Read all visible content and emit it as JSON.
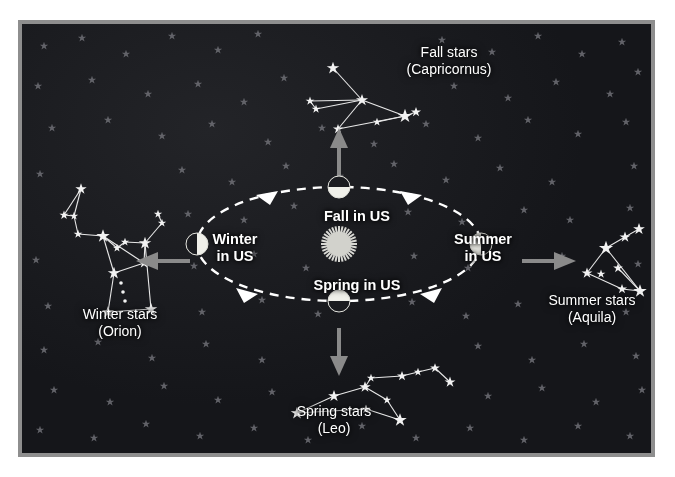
{
  "diagram": {
    "type": "astronomy-orbit-diagram",
    "background_color": "#15161a",
    "frame_color": "#8e8e8e",
    "page_color": "#ffffff"
  },
  "sun": {
    "name": "Sun",
    "color": "#d7d7d2",
    "cx": 334,
    "cy": 237
  },
  "orbit": {
    "style": "dashed-ellipse",
    "color": "#ffffff",
    "direction": "counterclockwise",
    "cx": 334,
    "cy": 237,
    "rx": 142,
    "ry": 57
  },
  "season_labels": [
    {
      "id": "fall",
      "text": "Fall in US",
      "position": "top"
    },
    {
      "id": "winter",
      "text": "Winter\nin US",
      "position": "left"
    },
    {
      "id": "summer",
      "text": "Summer\nin US",
      "position": "right"
    },
    {
      "id": "spring",
      "text": "Spring in US",
      "position": "bottom"
    }
  ],
  "constellation_labels": [
    {
      "id": "fall",
      "line1": "Fall stars",
      "line2": "(Capricornus)",
      "position": "top"
    },
    {
      "id": "winter",
      "line1": "Winter stars",
      "line2": "(Orion)",
      "position": "left"
    },
    {
      "id": "summer",
      "line1": "Summer stars",
      "line2": "(Aquila)",
      "position": "right"
    },
    {
      "id": "spring",
      "line1": "Spring stars",
      "line2": "(Leo)",
      "position": "bottom"
    }
  ],
  "earth_positions": [
    {
      "id": "fall",
      "cx": 334,
      "cy": 180,
      "lit_half": "bottom",
      "season": "Fall in US"
    },
    {
      "id": "winter",
      "cx": 192,
      "cy": 237,
      "lit_half": "right",
      "season": "Winter in US"
    },
    {
      "id": "summer",
      "cx": 476,
      "cy": 237,
      "lit_half": "left",
      "season": "Summer in US"
    },
    {
      "id": "spring",
      "cx": 334,
      "cy": 294,
      "lit_half": "top",
      "season": "Spring in US"
    }
  ],
  "view_arrows": [
    {
      "id": "fall",
      "direction": "up",
      "color": "#8a8a8a"
    },
    {
      "id": "winter",
      "direction": "left",
      "color": "#8a8a8a"
    },
    {
      "id": "summer",
      "direction": "right",
      "color": "#8a8a8a"
    },
    {
      "id": "spring",
      "direction": "down",
      "color": "#8a8a8a"
    }
  ],
  "constellations": {
    "capricornus": {
      "name": "Capricornus",
      "stars": [
        [
          311,
          44
        ],
        [
          288,
          77
        ],
        [
          294,
          85
        ],
        [
          340,
          76
        ],
        [
          316,
          105
        ],
        [
          355,
          98
        ],
        [
          383,
          92
        ],
        [
          394,
          88
        ]
      ],
      "lines": [
        [
          0,
          3
        ],
        [
          1,
          2
        ],
        [
          1,
          3
        ],
        [
          2,
          3
        ],
        [
          3,
          4
        ],
        [
          3,
          6
        ],
        [
          4,
          6
        ],
        [
          5,
          6
        ],
        [
          6,
          7
        ]
      ]
    },
    "orion": {
      "name": "Orion",
      "stars": [
        [
          59,
          165
        ],
        [
          42,
          191
        ],
        [
          52,
          192
        ],
        [
          56,
          210
        ],
        [
          81,
          212
        ],
        [
          95,
          224
        ],
        [
          103,
          218
        ],
        [
          123,
          219
        ],
        [
          92,
          249
        ],
        [
          98,
          263
        ],
        [
          104,
          276
        ],
        [
          86,
          288
        ],
        [
          129,
          285
        ],
        [
          136,
          190
        ],
        [
          140,
          199
        ],
        [
          122,
          239
        ]
      ],
      "lines": [
        [
          0,
          1
        ],
        [
          0,
          2
        ],
        [
          1,
          2
        ],
        [
          2,
          3
        ],
        [
          3,
          4
        ],
        [
          4,
          5
        ],
        [
          5,
          6
        ],
        [
          6,
          7
        ],
        [
          7,
          15
        ],
        [
          15,
          4
        ],
        [
          4,
          8
        ],
        [
          8,
          11
        ],
        [
          11,
          12
        ],
        [
          12,
          7
        ],
        [
          13,
          14
        ],
        [
          14,
          7
        ]
      ]
    },
    "aquila": {
      "name": "Aquila",
      "stars": [
        [
          584,
          224
        ],
        [
          603,
          213
        ],
        [
          617,
          205
        ],
        [
          565,
          249
        ],
        [
          596,
          244
        ],
        [
          579,
          250
        ],
        [
          600,
          265
        ],
        [
          618,
          267
        ]
      ],
      "lines": [
        [
          0,
          1
        ],
        [
          1,
          2
        ],
        [
          0,
          3
        ],
        [
          0,
          7
        ],
        [
          3,
          6
        ],
        [
          6,
          7
        ],
        [
          4,
          7
        ]
      ]
    },
    "leo": {
      "name": "Leo",
      "stars": [
        [
          275,
          389
        ],
        [
          312,
          372
        ],
        [
          344,
          385
        ],
        [
          343,
          363
        ],
        [
          349,
          354
        ],
        [
          365,
          376
        ],
        [
          378,
          396
        ],
        [
          380,
          352
        ],
        [
          396,
          348
        ],
        [
          413,
          344
        ],
        [
          428,
          358
        ]
      ],
      "lines": [
        [
          0,
          1
        ],
        [
          0,
          2
        ],
        [
          1,
          3
        ],
        [
          2,
          6
        ],
        [
          3,
          4
        ],
        [
          3,
          5
        ],
        [
          5,
          6
        ],
        [
          4,
          7
        ],
        [
          7,
          8
        ],
        [
          8,
          9
        ],
        [
          9,
          10
        ]
      ]
    }
  }
}
